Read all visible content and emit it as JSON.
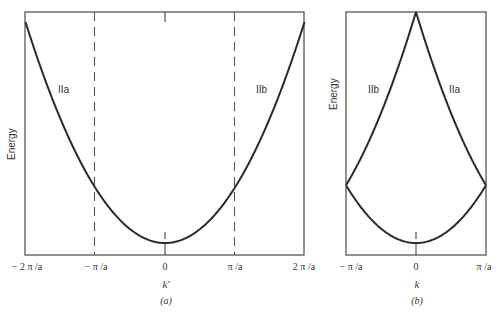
{
  "panels": [
    {
      "id": "a",
      "caption": "(a)",
      "y_label": "Energy",
      "x_label": "k'",
      "x_ticks": [
        "− 2 π /a",
        "− π /a",
        "0",
        "π /a",
        "2 π /a"
      ],
      "branch_labels": [
        "IIa",
        "IIb"
      ],
      "center_marker": "I",
      "dashed_lines_at": [
        "− π /a",
        "π /a"
      ],
      "description": "Extended-zone free-electron parabola E ∝ k'^2 from −2π/a to 2π/a"
    },
    {
      "id": "b",
      "caption": "(b)",
      "y_label": "Energy",
      "x_label": "k",
      "x_ticks": [
        "− π /a",
        "0",
        "π /a"
      ],
      "branch_labels": [
        "IIb",
        "IIa"
      ],
      "center_marker": "I",
      "description": "Reduced-zone scheme: branches IIa and IIb folded into first Brillouin zone, meeting at k=0 apex"
    }
  ],
  "colors": {
    "line": "#2a2a2a",
    "frame": "#4a4a4a",
    "dash": "#555555",
    "background": "#ffffff"
  }
}
